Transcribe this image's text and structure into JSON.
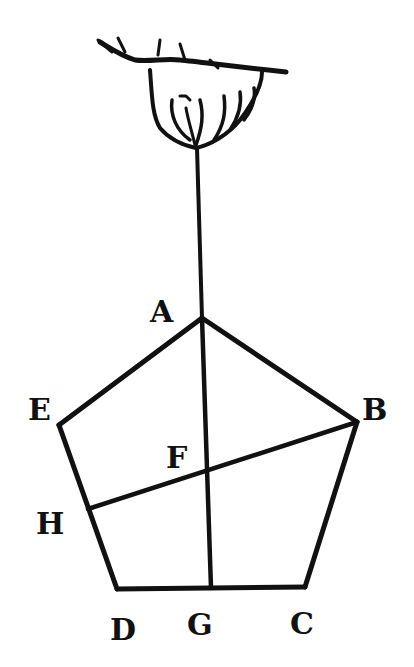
{
  "figure": {
    "background": "#ffffff",
    "ink": "#111111"
  },
  "points": {
    "A": {
      "label": "A",
      "x": 202,
      "y": 318,
      "lx": 160,
      "ly": 322
    },
    "B": {
      "label": "B",
      "x": 357,
      "y": 422,
      "lx": 378,
      "ly": 420
    },
    "C": {
      "label": "C",
      "x": 305,
      "y": 587,
      "lx": 305,
      "ly": 634
    },
    "D": {
      "label": "D",
      "x": 117,
      "y": 589,
      "lx": 130,
      "ly": 640
    },
    "E": {
      "label": "E",
      "x": 59,
      "y": 425,
      "lx": 42,
      "ly": 420
    },
    "F": {
      "label": "F",
      "x": 207,
      "y": 470,
      "lx": 180,
      "ly": 468
    },
    "G": {
      "label": "G",
      "x": 211,
      "y": 588,
      "lx": 207,
      "ly": 635
    },
    "H": {
      "label": "H",
      "x": 88,
      "y": 509,
      "lx": 58,
      "ly": 534
    }
  },
  "segments": [
    [
      "A",
      "B"
    ],
    [
      "B",
      "C"
    ],
    [
      "C",
      "D"
    ],
    [
      "D",
      "E"
    ],
    [
      "E",
      "A"
    ],
    [
      "A",
      "G"
    ],
    [
      "B",
      "H"
    ]
  ],
  "plumb_line": {
    "from": {
      "x": 197,
      "y": 150
    },
    "to": {
      "x": 202,
      "y": 318
    }
  },
  "hand": {
    "icon": "pointing-hand-holding-string"
  }
}
